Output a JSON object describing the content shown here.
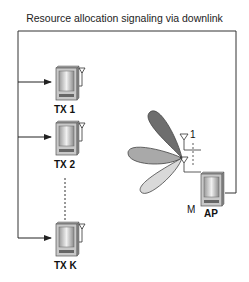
{
  "title": "Resource allocation signaling via downlink",
  "transmitters": [
    {
      "label": "TX 1"
    },
    {
      "label": "TX 2"
    },
    {
      "label": "TX K"
    }
  ],
  "access_point": {
    "label": "AP",
    "antenna_first": "1",
    "antenna_last": "M"
  },
  "beams": [
    {
      "name": "beam-upper",
      "color": "#6e6e6e"
    },
    {
      "name": "beam-middle",
      "color": "#a9a9a9"
    },
    {
      "name": "beam-lower",
      "color": "#d9d9d9"
    }
  ],
  "colors": {
    "line": "#333333",
    "device_body": "#c8c8c8",
    "device_screen": "#e6e6e6"
  }
}
